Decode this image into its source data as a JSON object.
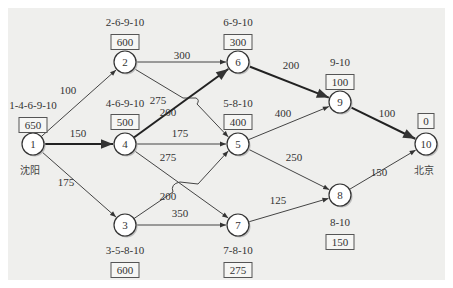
{
  "diagram": {
    "type": "shortest-path-network",
    "cities": {
      "source": "沈阳",
      "source_node": "1",
      "target": "北京",
      "target_node": "10"
    },
    "nodes": [
      {
        "id": "1",
        "path": "1-4-6-9-10",
        "distance": "650"
      },
      {
        "id": "2",
        "path": "2-6-9-10",
        "distance": "600"
      },
      {
        "id": "3",
        "path": "3-5-8-10",
        "distance": "600"
      },
      {
        "id": "4",
        "path": "4-6-9-10",
        "distance": "500"
      },
      {
        "id": "5",
        "path": "5-8-10",
        "distance": "400"
      },
      {
        "id": "6",
        "path": "6-9-10",
        "distance": "300"
      },
      {
        "id": "7",
        "path": "7-8-10",
        "distance": "275"
      },
      {
        "id": "8",
        "path": "8-10",
        "distance": "150"
      },
      {
        "id": "9",
        "path": "9-10",
        "distance": "100"
      },
      {
        "id": "10",
        "path": "",
        "distance": "0"
      }
    ],
    "edges": [
      {
        "from": "1",
        "to": "2",
        "weight": "100",
        "on_shortest_path": false
      },
      {
        "from": "1",
        "to": "4",
        "weight": "150",
        "on_shortest_path": true
      },
      {
        "from": "1",
        "to": "3",
        "weight": "175",
        "on_shortest_path": false
      },
      {
        "from": "2",
        "to": "6",
        "weight": "300",
        "on_shortest_path": false
      },
      {
        "from": "2",
        "to": "5",
        "weight": "275",
        "on_shortest_path": false
      },
      {
        "from": "4",
        "to": "6",
        "weight": "200",
        "on_shortest_path": true
      },
      {
        "from": "4",
        "to": "5",
        "weight": "175",
        "on_shortest_path": false
      },
      {
        "from": "4",
        "to": "7",
        "weight": "275",
        "on_shortest_path": false
      },
      {
        "from": "3",
        "to": "5",
        "weight": "200",
        "on_shortest_path": false
      },
      {
        "from": "3",
        "to": "7",
        "weight": "350",
        "on_shortest_path": false
      },
      {
        "from": "6",
        "to": "9",
        "weight": "200",
        "on_shortest_path": true
      },
      {
        "from": "5",
        "to": "9",
        "weight": "400",
        "on_shortest_path": false
      },
      {
        "from": "5",
        "to": "8",
        "weight": "250",
        "on_shortest_path": false
      },
      {
        "from": "7",
        "to": "8",
        "weight": "125",
        "on_shortest_path": false
      },
      {
        "from": "9",
        "to": "10",
        "weight": "100",
        "on_shortest_path": true
      },
      {
        "from": "8",
        "to": "10",
        "weight": "150",
        "on_shortest_path": false
      }
    ]
  }
}
